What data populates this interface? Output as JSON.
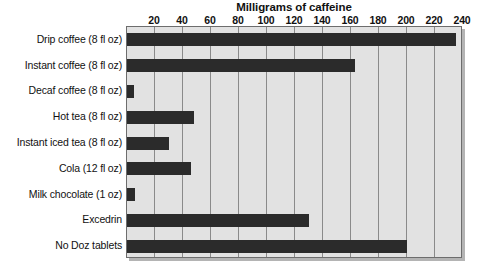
{
  "chart_data": {
    "type": "bar",
    "orientation": "horizontal",
    "title": "Milligrams of caffeine",
    "xlabel": "",
    "ylabel": "",
    "xlim": [
      0,
      240
    ],
    "ylim": null,
    "grid": true,
    "legend": null,
    "xticks": [
      20,
      40,
      60,
      80,
      100,
      120,
      140,
      160,
      180,
      200,
      220,
      240
    ],
    "xtick_labels": [
      "20",
      "40",
      "60",
      "80",
      "100",
      "120",
      "140",
      "160",
      "180",
      "200",
      "220",
      "240"
    ],
    "categories": [
      "Drip coffee (8 fl oz)",
      "Instant coffee (8 fl oz)",
      "Decaf coffee (8 fl oz)",
      "Hot tea (8 fl oz)",
      "Instant iced tea (8 fl oz)",
      "Cola (12 fl oz)",
      "Milk chocolate (1 oz)",
      "Excedrin",
      "No Doz tablets"
    ],
    "values": [
      235,
      163,
      5,
      48,
      30,
      46,
      6,
      130,
      200
    ],
    "bar_color": "#2b2b2b",
    "plot_background": "#e2e2e2",
    "gridline_color": "#8a8a8a",
    "axis_color": "#6d6d6d"
  }
}
